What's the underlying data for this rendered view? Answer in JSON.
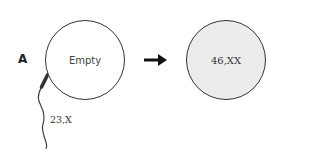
{
  "panel": {
    "label": "A"
  },
  "egg": {
    "label": "Empty",
    "fill": "#ffffff"
  },
  "sperm": {
    "label": "23,X"
  },
  "arrow": {
    "direction": "right",
    "icon": "arrow-right-icon"
  },
  "zygote": {
    "label": "46,XX",
    "fill": "#ececec"
  }
}
